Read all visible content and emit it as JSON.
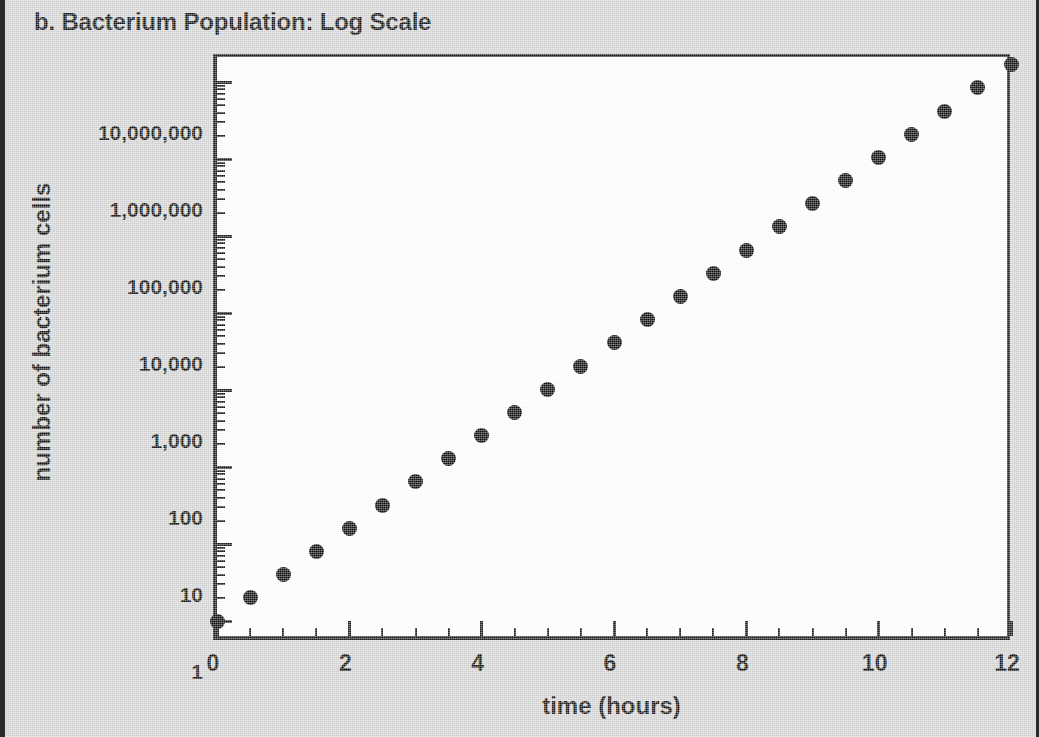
{
  "figure": {
    "panel_label": "b.",
    "title": "b. Bacterium Population: Log Scale",
    "background_color": "#d5d5d5",
    "plot_background_color": "#ffffff",
    "axis_color": "#1a1a1a",
    "marker_color": "#0d0d0d"
  },
  "chart_data": {
    "type": "scatter",
    "title": "b. Bacterium Population: Log Scale",
    "xlabel": "time (hours)",
    "ylabel": "number of bacterium cells",
    "yscale": "log",
    "xscale": "linear",
    "xlim": [
      0,
      12
    ],
    "ylim": [
      1,
      32000000
    ],
    "grid": false,
    "legend": null,
    "xticks": [
      0,
      2,
      4,
      6,
      8,
      10,
      12
    ],
    "xticklabels": [
      "0",
      "2",
      "4",
      "6",
      "8",
      "10",
      "12"
    ],
    "xminor_tick_step": 0.5,
    "yticks": [
      1,
      10,
      100,
      1000,
      10000,
      100000,
      1000000,
      10000000
    ],
    "yticklabels": [
      "1",
      "10",
      "100",
      "1,000",
      "10,000",
      "100,000",
      "1,000,000",
      "10,000,000"
    ],
    "x": [
      0,
      0.5,
      1,
      1.5,
      2,
      2.5,
      3,
      3.5,
      4,
      4.5,
      5,
      5.5,
      6,
      6.5,
      7,
      7.5,
      8,
      8.5,
      9,
      9.5,
      10,
      10.5,
      11,
      11.5,
      12
    ],
    "values": [
      1,
      2,
      4,
      8,
      16,
      32,
      64,
      128,
      256,
      512,
      1024,
      2048,
      4096,
      8192,
      16384,
      32768,
      65536,
      131072,
      262144,
      524288,
      1048576,
      2097152,
      4194304,
      8388608,
      16777216
    ],
    "series": [
      {
        "name": "bacterium cells",
        "marker": "filled-circle",
        "values": [
          1,
          2,
          4,
          8,
          16,
          32,
          64,
          128,
          256,
          512,
          1024,
          2048,
          4096,
          8192,
          16384,
          32768,
          65536,
          131072,
          262144,
          524288,
          1048576,
          2097152,
          4194304,
          8388608,
          16777216
        ]
      }
    ]
  }
}
